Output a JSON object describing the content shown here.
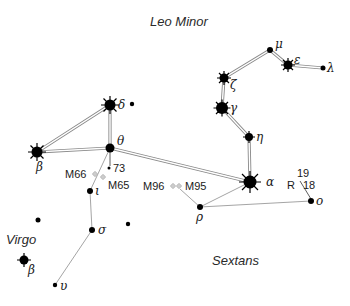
{
  "constellation_labels": {
    "leo_minor": "Leo Minor",
    "virgo": "Virgo",
    "sextans": "Sextans"
  },
  "stars": {
    "mu": {
      "label": "μ",
      "x": 270,
      "y": 50,
      "r": 3,
      "bright": false
    },
    "eps": {
      "label": "ε",
      "x": 288,
      "y": 65,
      "r": 4.5,
      "bright": true
    },
    "lam": {
      "label": "λ",
      "x": 323,
      "y": 68,
      "r": 2.5,
      "bright": false
    },
    "zeta": {
      "label": "ζ",
      "x": 224,
      "y": 78,
      "r": 4.5,
      "bright": true
    },
    "gam": {
      "label": "γ",
      "x": 222,
      "y": 108,
      "r": 6,
      "bright": true
    },
    "eta": {
      "label": "η",
      "x": 249,
      "y": 137,
      "r": 4,
      "bright": true
    },
    "alp": {
      "label": "α",
      "x": 250,
      "y": 182,
      "r": 6.5,
      "bright": true
    },
    "del": {
      "label": "δ",
      "x": 110,
      "y": 105,
      "r": 5.5,
      "bright": true
    },
    "the": {
      "label": "θ",
      "x": 110,
      "y": 148,
      "r": 4.5,
      "bright": false
    },
    "betL": {
      "label": "β",
      "x": 37,
      "y": 152,
      "r": 5.5,
      "bright": true
    },
    "iot": {
      "label": "ι",
      "x": 90,
      "y": 191,
      "r": 3,
      "bright": false
    },
    "sig": {
      "label": "σ",
      "x": 92,
      "y": 230,
      "r": 3,
      "bright": false
    },
    "ups": {
      "label": "υ",
      "x": 55,
      "y": 285,
      "r": 2.2,
      "bright": false
    },
    "rho": {
      "label": "ρ",
      "x": 200,
      "y": 207,
      "r": 3,
      "bright": false
    },
    "omi": {
      "label": "ο",
      "x": 311,
      "y": 201,
      "r": 3,
      "bright": false
    },
    "betV": {
      "label": "β",
      "x": 24,
      "y": 260,
      "r": 4.5,
      "bright": true
    }
  },
  "deep_sky": {
    "m66": "M66",
    "m65": "M65",
    "m96": "M96",
    "m95": "M95"
  },
  "numbered_stars": {
    "s73": "73",
    "s19": "19",
    "s18": "18",
    "r_var": "R"
  }
}
